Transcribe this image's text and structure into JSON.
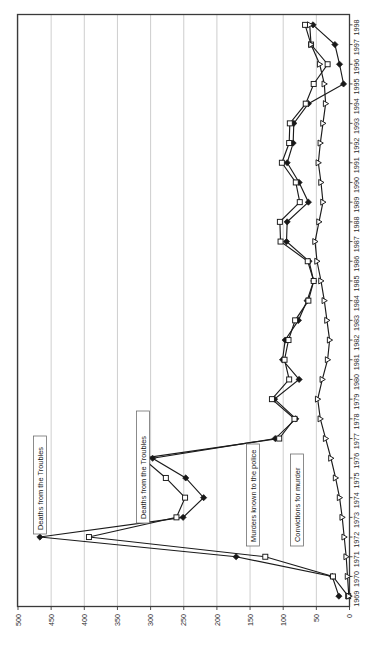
{
  "chart_data": {
    "type": "line",
    "title": "",
    "subtitle": "",
    "orientation": "rotated-90",
    "xlabel": "",
    "ylabel": "",
    "grid": true,
    "legend_position": "inline-annotations",
    "ylim": [
      0,
      500
    ],
    "y_ticks": [
      "0",
      "50",
      "100",
      "150",
      "200",
      "250",
      "300",
      "350",
      "400",
      "450",
      "500"
    ],
    "categories": [
      "1969",
      "1970",
      "1971",
      "1972",
      "1973",
      "1974",
      "1975",
      "1976",
      "1977",
      "1978",
      "1979",
      "1980",
      "1981",
      "1982",
      "1983",
      "1984",
      "1985",
      "1986",
      "1987",
      "1988",
      "1989",
      "1990",
      "1991",
      "1992",
      "1993",
      "1994",
      "1995",
      "1996",
      "1997",
      "1998"
    ],
    "series": [
      {
        "name": "Deaths from the Troubles",
        "marker": "diamond",
        "values": [
          16,
          26,
          171,
          467,
          251,
          220,
          247,
          297,
          112,
          81,
          113,
          76,
          101,
          97,
          77,
          64,
          54,
          61,
          95,
          94,
          62,
          76,
          94,
          85,
          84,
          62,
          9,
          15,
          22,
          55
        ]
      },
      {
        "name": "Murders known to the police",
        "marker": "square",
        "values": [
          2,
          25,
          127,
          393,
          261,
          248,
          277,
          312,
          106,
          83,
          117,
          91,
          98,
          92,
          82,
          62,
          54,
          63,
          104,
          105,
          75,
          81,
          102,
          91,
          90,
          66,
          54,
          33,
          58,
          67
        ]
      },
      {
        "name": "Convictions for murder",
        "marker": "triangle",
        "values": [
          1,
          3,
          5,
          8,
          11,
          15,
          21,
          28,
          36,
          44,
          48,
          41,
          33,
          30,
          34,
          38,
          43,
          49,
          52,
          46,
          40,
          43,
          47,
          44,
          40,
          36,
          38,
          45,
          58,
          60
        ]
      }
    ],
    "annotations": [
      {
        "text": "Deaths from the Troubles",
        "id": "annotation-deaths-1"
      },
      {
        "text": "Deaths from the Troubles",
        "id": "annotation-deaths-2"
      },
      {
        "text": "Murders known to the police",
        "id": "annotation-murders"
      },
      {
        "text": "Convictions for murder",
        "id": "annotation-convictions"
      }
    ],
    "colors": {
      "line": "#1b1b1b",
      "grid": "#b9b9b9",
      "axis": "#3a3a3a",
      "background": "#ffffff"
    }
  }
}
